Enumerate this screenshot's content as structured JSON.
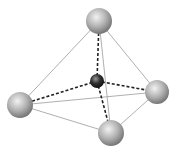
{
  "diagram": {
    "type": "tetrahedral-molecule",
    "outer_atom_color": "#a8a8a8",
    "center_atom_color": "#333333",
    "edge_color": "#aaaaaa",
    "bond_color": "#222222",
    "atoms": [
      {
        "id": "top",
        "cx": 99,
        "cy": 21,
        "r": 13
      },
      {
        "id": "right",
        "cx": 157,
        "cy": 92,
        "r": 12
      },
      {
        "id": "left",
        "cx": 20,
        "cy": 105,
        "r": 13
      },
      {
        "id": "bottom",
        "cx": 111,
        "cy": 133,
        "r": 13
      }
    ],
    "center": {
      "cx": 97,
      "cy": 81,
      "r": 7
    }
  }
}
